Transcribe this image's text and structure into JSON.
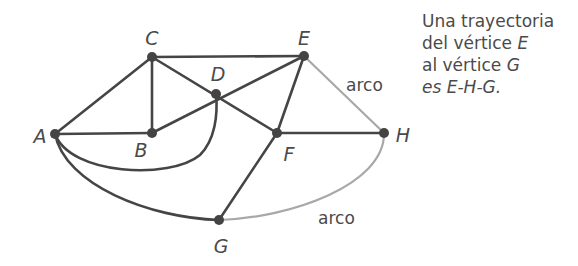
{
  "vertices": {
    "A": {
      "label": "A",
      "x": 55,
      "y": 134
    },
    "B": {
      "label": "B",
      "x": 152,
      "y": 133
    },
    "C": {
      "label": "C",
      "x": 152,
      "y": 57
    },
    "D": {
      "label": "D",
      "x": 216,
      "y": 94
    },
    "E": {
      "label": "E",
      "x": 304,
      "y": 56
    },
    "F": {
      "label": "F",
      "x": 277,
      "y": 133
    },
    "G": {
      "label": "G",
      "x": 219,
      "y": 220
    },
    "H": {
      "label": "H",
      "x": 384,
      "y": 133
    }
  },
  "edges": [
    {
      "from": "A",
      "to": "C",
      "type": "straight",
      "highlight": false
    },
    {
      "from": "A",
      "to": "B",
      "type": "straight",
      "highlight": false
    },
    {
      "from": "C",
      "to": "B",
      "type": "straight",
      "highlight": false
    },
    {
      "from": "C",
      "to": "E",
      "type": "straight",
      "highlight": false
    },
    {
      "from": "C",
      "to": "F",
      "type": "straight",
      "highlight": false
    },
    {
      "from": "B",
      "to": "E",
      "type": "straight",
      "highlight": false
    },
    {
      "from": "E",
      "to": "F",
      "type": "straight",
      "highlight": false
    },
    {
      "from": "F",
      "to": "H",
      "type": "straight",
      "highlight": false
    },
    {
      "from": "F",
      "to": "G",
      "type": "straight",
      "highlight": false
    },
    {
      "from": "A",
      "to": "D",
      "type": "curve",
      "highlight": false
    },
    {
      "from": "A",
      "to": "G",
      "type": "curve",
      "highlight": false
    },
    {
      "from": "E",
      "to": "H",
      "type": "straight",
      "highlight": true
    },
    {
      "from": "H",
      "to": "G",
      "type": "curve",
      "highlight": true
    }
  ],
  "labels": {
    "A": "A",
    "B": "B",
    "C": "C",
    "D": "D",
    "E": "E",
    "F": "F",
    "G": "G",
    "H": "H",
    "arc_top": "arco",
    "arc_bottom": "arco"
  },
  "caption": {
    "line1": "Una trayectoria",
    "line2_text": "del vértice ",
    "line2_var": "E",
    "line3_text": "al vértice ",
    "line3_var": "G",
    "line4": "es E-H-G."
  },
  "colors": {
    "edge": "#454545",
    "highlight_edge": "#a8a8a8",
    "vertex": "#444444",
    "text": "#4a4a4a"
  }
}
